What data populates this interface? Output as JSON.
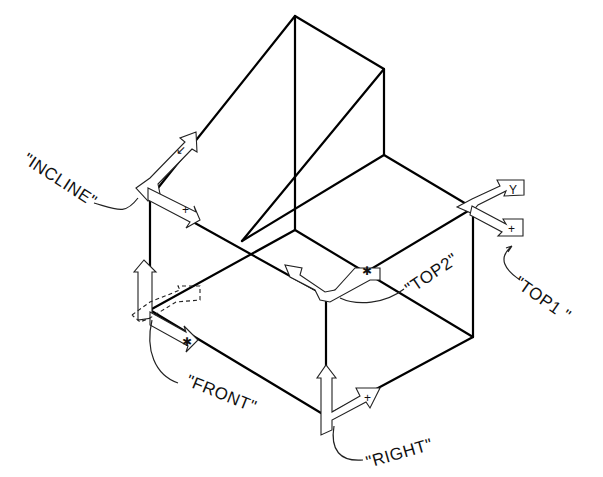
{
  "diagram": {
    "type": "isometric-solid-with-ucs-icons",
    "labels": {
      "incline": "\"INCLINE\"",
      "top1": "\"TOP1 \"",
      "top2": "\"TOP2\"",
      "front": "\"FRONT\"",
      "right": "\"RIGHT\""
    },
    "axis_glyphs": {
      "x": "+",
      "y": "Y"
    },
    "colors": {
      "line": "#000000",
      "background": "#ffffff"
    }
  }
}
